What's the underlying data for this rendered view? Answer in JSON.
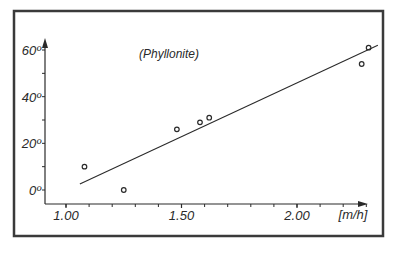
{
  "chart_data": {
    "type": "scatter",
    "title": "(Phyllonite)",
    "xlabel": "[m/h]",
    "ylabel": "",
    "xlim": [
      0.95,
      2.45
    ],
    "ylim": [
      -8,
      63
    ],
    "x_ticks": [
      1.0,
      1.5,
      2.0
    ],
    "x_tick_labels": [
      "1.00",
      "1.50",
      "2.00"
    ],
    "x_minor_step": 0.1,
    "y_ticks": [
      0,
      20,
      40,
      60
    ],
    "y_tick_labels": [
      "0º",
      "20º",
      "40º",
      "60º"
    ],
    "y_minor_step": 10,
    "grid": false,
    "legend": null,
    "series": [
      {
        "name": "measurements",
        "marker": "open-circle",
        "points": [
          {
            "x": 1.08,
            "y": 10
          },
          {
            "x": 1.25,
            "y": 0
          },
          {
            "x": 1.48,
            "y": 26
          },
          {
            "x": 1.58,
            "y": 29
          },
          {
            "x": 1.62,
            "y": 31
          },
          {
            "x": 2.28,
            "y": 54
          },
          {
            "x": 2.31,
            "y": 61
          }
        ]
      },
      {
        "name": "regression-line",
        "type": "line",
        "points": [
          {
            "x": 1.06,
            "y": 2.6
          },
          {
            "x": 2.35,
            "y": 62
          }
        ]
      }
    ]
  },
  "colors": {
    "ink": "#2a2a2a",
    "frame": "#3a3a3a",
    "background": "#ffffff"
  }
}
